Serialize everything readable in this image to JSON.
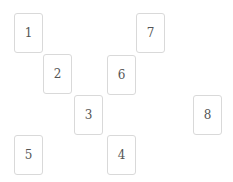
{
  "cards": [
    {
      "label": "1",
      "x": 14,
      "y": 13
    },
    {
      "label": "2",
      "x": 43,
      "y": 54
    },
    {
      "label": "3",
      "x": 74,
      "y": 95
    },
    {
      "label": "4",
      "x": 107,
      "y": 135
    },
    {
      "label": "5",
      "x": 14,
      "y": 135
    },
    {
      "label": "6",
      "x": 107,
      "y": 55
    },
    {
      "label": "7",
      "x": 136,
      "y": 13
    },
    {
      "label": "8",
      "x": 193,
      "y": 95
    }
  ]
}
